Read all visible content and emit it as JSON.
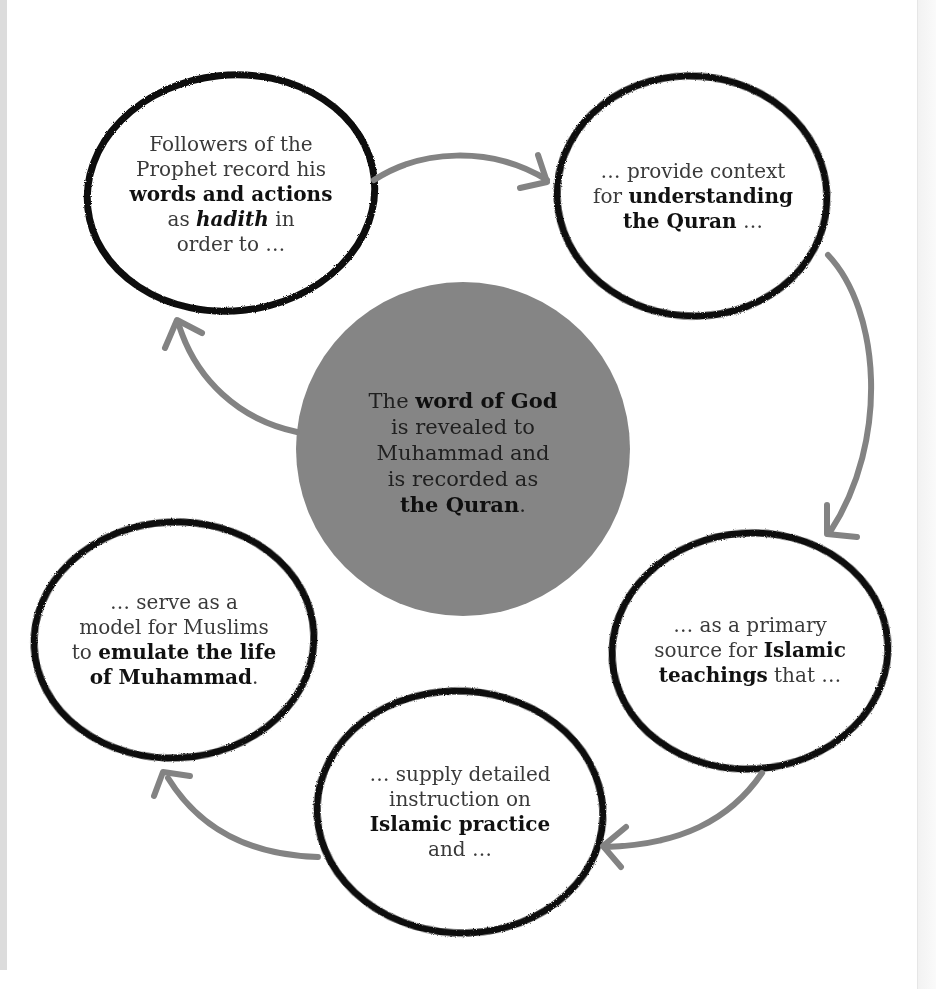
{
  "diagram": {
    "type": "cycle",
    "colors": {
      "background": "#ffffff",
      "center_fill": "#858585",
      "bubble_outline": "#0d0d0d",
      "arrow": "#838383",
      "text": "#333333",
      "bold_text": "#111111"
    },
    "center": {
      "lines": [
        {
          "pre": "The ",
          "bold": "word of God",
          "post": ""
        },
        {
          "pre": "is revealed to",
          "bold": "",
          "post": ""
        },
        {
          "pre": "Muhammad and",
          "bold": "",
          "post": ""
        },
        {
          "pre": "is recorded as",
          "bold": "",
          "post": ""
        },
        {
          "pre": "",
          "bold": "the Quran",
          "post": "."
        }
      ]
    },
    "nodes": [
      {
        "id": "hadith",
        "lines": [
          {
            "pre": "Followers of the",
            "bold": "",
            "post": ""
          },
          {
            "pre": "Prophet record his",
            "bold": "",
            "post": ""
          },
          {
            "pre": "",
            "bold": "words and actions",
            "post": ""
          },
          {
            "pre": "as ",
            "bold": "hadith",
            "post": " in",
            "italic": true
          },
          {
            "pre": "order to …",
            "bold": "",
            "post": ""
          }
        ]
      },
      {
        "id": "context",
        "lines": [
          {
            "pre": "… provide context",
            "bold": "",
            "post": ""
          },
          {
            "pre": "for ",
            "bold": "understanding",
            "post": ""
          },
          {
            "pre": "",
            "bold": "the Quran",
            "post": " …"
          }
        ]
      },
      {
        "id": "source",
        "lines": [
          {
            "pre": "… as a primary",
            "bold": "",
            "post": ""
          },
          {
            "pre": "source for ",
            "bold": "Islamic",
            "post": ""
          },
          {
            "pre": "",
            "bold": "teachings",
            "post": " that …"
          }
        ]
      },
      {
        "id": "practice",
        "lines": [
          {
            "pre": "… supply detailed",
            "bold": "",
            "post": ""
          },
          {
            "pre": "instruction on",
            "bold": "",
            "post": ""
          },
          {
            "pre": "",
            "bold": "Islamic practice",
            "post": ""
          },
          {
            "pre": "and …",
            "bold": "",
            "post": ""
          }
        ]
      },
      {
        "id": "model",
        "lines": [
          {
            "pre": "… serve as a",
            "bold": "",
            "post": ""
          },
          {
            "pre": "model for Muslims",
            "bold": "",
            "post": ""
          },
          {
            "pre": "to ",
            "bold": "emulate the life",
            "post": ""
          },
          {
            "pre": "",
            "bold": "of Muhammad",
            "post": "."
          }
        ]
      }
    ],
    "arrows": [
      {
        "from": "hadith",
        "to": "context"
      },
      {
        "from": "context",
        "to": "source"
      },
      {
        "from": "source",
        "to": "practice"
      },
      {
        "from": "practice",
        "to": "model"
      },
      {
        "from": "center",
        "to": "hadith"
      }
    ]
  }
}
